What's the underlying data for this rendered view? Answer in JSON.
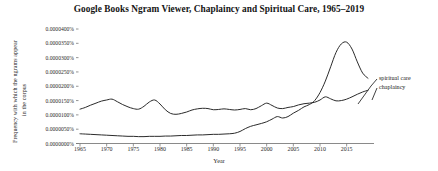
{
  "chart_data": {
    "type": "line",
    "title": "Google Books Ngram Viewer, Chaplaincy and Spiritual Care, 1965–2019",
    "xlabel": "Year",
    "ylabel": "Frequency with which the ngrams appear in the corpus",
    "ylabel_line1": "Frequency with which the ngrams appear",
    "ylabel_line2": "in the corpus",
    "grid": false,
    "legend_position": "right-inline-annotation",
    "xlim": [
      1965,
      2019
    ],
    "ylim": [
      0.0,
      4e-06
    ],
    "xticks": [
      1965,
      1970,
      1975,
      1980,
      1985,
      1990,
      1995,
      2000,
      2005,
      2010,
      2015
    ],
    "xtick_labels": [
      "1965",
      "1970",
      "1975",
      "1980",
      "1985",
      "1990",
      "1995",
      "2000",
      "2005",
      "2010",
      "2015"
    ],
    "yticks": [
      0.0,
      5e-07,
      1e-06,
      1.5e-06,
      2e-06,
      2.5e-06,
      3e-06,
      3.5e-06,
      4e-06
    ],
    "ytick_labels": [
      "0.0000000%",
      "0.0000050%",
      "0.0000100%",
      "0.0000150%",
      "0.0000200%",
      "0.0000250%",
      "0.0000300%",
      "0.0000350%",
      "0.0000400%"
    ],
    "line_color": "#2b2b2b",
    "x": [
      1965,
      1966,
      1967,
      1968,
      1969,
      1970,
      1971,
      1972,
      1973,
      1974,
      1975,
      1976,
      1977,
      1978,
      1979,
      1980,
      1981,
      1982,
      1983,
      1984,
      1985,
      1986,
      1987,
      1988,
      1989,
      1990,
      1991,
      1992,
      1993,
      1994,
      1995,
      1996,
      1997,
      1998,
      1999,
      2000,
      2001,
      2002,
      2003,
      2004,
      2005,
      2006,
      2007,
      2008,
      2009,
      2010,
      2011,
      2012,
      2013,
      2014,
      2015,
      2016,
      2017,
      2018,
      2019
    ],
    "series": [
      {
        "name": "chaplaincy",
        "label": "chaplaincy",
        "values": [
          1.2e-06,
          1.26e-06,
          1.34e-06,
          1.41e-06,
          1.48e-06,
          1.52e-06,
          1.55e-06,
          1.46e-06,
          1.36e-06,
          1.28e-06,
          1.22e-06,
          1.2e-06,
          1.3e-06,
          1.45e-06,
          1.52e-06,
          1.38e-06,
          1.18e-06,
          1.05e-06,
          1.02e-06,
          1.05e-06,
          1.1e-06,
          1.17e-06,
          1.21e-06,
          1.23e-06,
          1.22e-06,
          1.18e-06,
          1.19e-06,
          1.21e-06,
          1.19e-06,
          1.17e-06,
          1.19e-06,
          1.22e-06,
          1.18e-06,
          1.22e-06,
          1.32e-06,
          1.41e-06,
          1.33e-06,
          1.24e-06,
          1.22e-06,
          1.26e-06,
          1.29e-06,
          1.35e-06,
          1.39e-06,
          1.41e-06,
          1.44e-06,
          1.52e-06,
          1.63e-06,
          1.56e-06,
          1.49e-06,
          1.5e-06,
          1.55e-06,
          1.63e-06,
          1.72e-06,
          1.8e-06,
          1.86e-06
        ]
      },
      {
        "name": "spiritual care",
        "label": "spiritual care",
        "values": [
          3.4e-07,
          3.3e-07,
          3.2e-07,
          3.1e-07,
          3e-07,
          2.9e-07,
          2.8e-07,
          2.7e-07,
          2.6e-07,
          2.5e-07,
          2.5e-07,
          2.4e-07,
          2.4e-07,
          2.5e-07,
          2.5e-07,
          2.5e-07,
          2.6e-07,
          2.6e-07,
          2.7e-07,
          2.8e-07,
          2.8e-07,
          2.9e-07,
          3e-07,
          3e-07,
          3.1e-07,
          3.2e-07,
          3.2e-07,
          3.3e-07,
          3.4e-07,
          3.6e-07,
          4.2e-07,
          5.2e-07,
          6e-07,
          6.5e-07,
          7e-07,
          7.6e-07,
          8.5e-07,
          9.4e-07,
          8.9e-07,
          9.4e-07,
          1.06e-06,
          1.16e-06,
          1.28e-06,
          1.36e-06,
          1.5e-06,
          1.78e-06,
          2.18e-06,
          2.68e-06,
          3.18e-06,
          3.48e-06,
          3.54e-06,
          3.3e-06,
          2.85e-06,
          2.46e-06,
          2.28e-06
        ]
      }
    ]
  }
}
